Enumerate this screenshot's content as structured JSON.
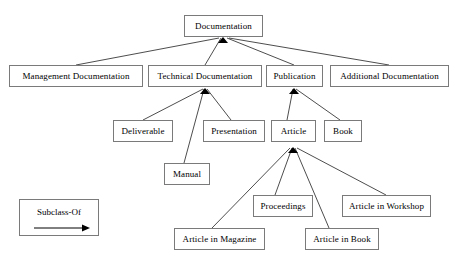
{
  "diagram": {
    "type": "tree",
    "canvas": {
      "width": 455,
      "height": 263
    },
    "style": {
      "box_border_color": "#7a7a7a",
      "box_fill_color": "#ffffff",
      "edge_color": "#000000",
      "text_color": "#000000",
      "background": "#ffffff"
    },
    "nodes": [
      {
        "id": "documentation",
        "label": "Documentation",
        "x": 184,
        "y": 15,
        "w": 79,
        "h": 22
      },
      {
        "id": "management-documentation",
        "label": "Management Documentation",
        "x": 9,
        "y": 65,
        "w": 134,
        "h": 22
      },
      {
        "id": "technical-documentation",
        "label": "Technical Documentation",
        "x": 148,
        "y": 65,
        "w": 114,
        "h": 22
      },
      {
        "id": "publication",
        "label": "Publication",
        "x": 266,
        "y": 65,
        "w": 57,
        "h": 22
      },
      {
        "id": "additional-documentation",
        "label": "Additional Documentation",
        "x": 330,
        "y": 65,
        "w": 119,
        "h": 22
      },
      {
        "id": "deliverable",
        "label": "Deliverable",
        "x": 113,
        "y": 120,
        "w": 60,
        "h": 22
      },
      {
        "id": "presentation",
        "label": "Presentation",
        "x": 203,
        "y": 120,
        "w": 62,
        "h": 22
      },
      {
        "id": "article",
        "label": "Article",
        "x": 271,
        "y": 120,
        "w": 45,
        "h": 22
      },
      {
        "id": "book",
        "label": "Book",
        "x": 324,
        "y": 120,
        "w": 38,
        "h": 22
      },
      {
        "id": "manual",
        "label": "Manual",
        "x": 164,
        "y": 163,
        "w": 46,
        "h": 22
      },
      {
        "id": "proceedings",
        "label": "Proceedings",
        "x": 253,
        "y": 195,
        "w": 60,
        "h": 22
      },
      {
        "id": "article-in-workshop",
        "label": "Article in Workshop",
        "x": 342,
        "y": 195,
        "w": 89,
        "h": 22
      },
      {
        "id": "article-in-magazine",
        "label": "Article in Magazine",
        "x": 174,
        "y": 228,
        "w": 91,
        "h": 22
      },
      {
        "id": "article-in-book",
        "label": "Article in Book",
        "x": 305,
        "y": 228,
        "w": 74,
        "h": 22
      }
    ],
    "edges": [
      {
        "id": "edge-management-to-documentation",
        "from": "management-documentation",
        "to": "documentation",
        "relation": "Subclass-Of",
        "x1": 76,
        "y1": 65,
        "x2": 219,
        "y2": 38
      },
      {
        "id": "edge-technical-to-documentation",
        "from": "technical-documentation",
        "to": "documentation",
        "relation": "Subclass-Of",
        "x1": 205,
        "y1": 65,
        "x2": 221,
        "y2": 38
      },
      {
        "id": "edge-publication-to-documentation",
        "from": "publication",
        "to": "documentation",
        "relation": "Subclass-Of",
        "x1": 294,
        "y1": 65,
        "x2": 227,
        "y2": 38
      },
      {
        "id": "edge-additional-to-documentation",
        "from": "additional-documentation",
        "to": "documentation",
        "relation": "Subclass-Of",
        "x1": 389,
        "y1": 65,
        "x2": 229,
        "y2": 38
      },
      {
        "id": "edge-deliverable-to-technical",
        "from": "deliverable",
        "to": "technical-documentation",
        "relation": "Subclass-Of",
        "x1": 143,
        "y1": 120,
        "x2": 203,
        "y2": 89
      },
      {
        "id": "edge-manual-to-technical",
        "from": "manual",
        "to": "technical-documentation",
        "relation": "Subclass-Of",
        "x1": 184,
        "y1": 163,
        "x2": 204,
        "y2": 89
      },
      {
        "id": "edge-presentation-to-technical",
        "from": "presentation",
        "to": "technical-documentation",
        "relation": "Subclass-Of",
        "x1": 231,
        "y1": 120,
        "x2": 207,
        "y2": 89
      },
      {
        "id": "edge-article-to-publication",
        "from": "article",
        "to": "publication",
        "relation": "Subclass-Of",
        "x1": 287,
        "y1": 120,
        "x2": 293,
        "y2": 89
      },
      {
        "id": "edge-book-to-publication",
        "from": "book",
        "to": "publication",
        "relation": "Subclass-Of",
        "x1": 340,
        "y1": 120,
        "x2": 296,
        "y2": 89
      },
      {
        "id": "edge-magazine-to-article",
        "from": "article-in-magazine",
        "to": "article",
        "relation": "Subclass-Of",
        "x1": 212,
        "y1": 228,
        "x2": 290,
        "y2": 148
      },
      {
        "id": "edge-proceedings-to-article",
        "from": "proceedings",
        "to": "article",
        "relation": "Subclass-Of",
        "x1": 275,
        "y1": 195,
        "x2": 292,
        "y2": 148
      },
      {
        "id": "edge-articleinbook-to-article",
        "from": "article-in-book",
        "to": "article",
        "relation": "Subclass-Of",
        "x1": 329,
        "y1": 228,
        "x2": 295,
        "y2": 148
      },
      {
        "id": "edge-workshop-to-article",
        "from": "article-in-workshop",
        "to": "article",
        "relation": "Subclass-Of",
        "x1": 386,
        "y1": 195,
        "x2": 297,
        "y2": 148
      }
    ],
    "arrow_targets": [
      {
        "id": "arrowhead-cluster-documentation",
        "x": 223,
        "y": 38
      },
      {
        "id": "arrowhead-cluster-technical",
        "x": 205,
        "y": 89
      },
      {
        "id": "arrowhead-cluster-publication",
        "x": 294,
        "y": 89
      },
      {
        "id": "arrowhead-cluster-article",
        "x": 293,
        "y": 148
      }
    ],
    "legend": {
      "label": "Subclass-Of",
      "x": 19,
      "y": 199,
      "w": 80,
      "h": 37
    }
  }
}
